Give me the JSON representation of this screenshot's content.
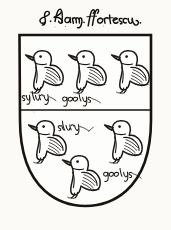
{
  "image": {
    "kind": "heraldic-shield-illustration",
    "medium": "pen-and-ink line drawing",
    "width": 171,
    "height": 230,
    "paper_color": "#fbfaf7",
    "ink_color": "#1a1713"
  },
  "caption": {
    "name": "caption-inscription",
    "transcription": "S. Hugh ffortescu",
    "reading_note": "cursive secretary-hand inscription above the shield",
    "position": "above-shield"
  },
  "shield": {
    "name": "coat-of-arms-shield",
    "outline_color": "#17130f",
    "field_color": "#fdfdfb",
    "shape": "flat-top-heater",
    "bounds": {
      "left": 18,
      "top": 34,
      "right": 152,
      "bottom": 206
    },
    "division": {
      "name": "fess-division-line",
      "type": "per fess",
      "y": 110
    },
    "blazon": "Six birds, three in chief and three in base, divided per fess"
  },
  "charges": [
    {
      "name": "bird-chief-dexter",
      "type": "chough",
      "row": "chief",
      "position": 1,
      "facing": "sinister"
    },
    {
      "name": "bird-chief-middle",
      "type": "chough",
      "row": "chief",
      "position": 2,
      "facing": "sinister"
    },
    {
      "name": "bird-chief-sinister",
      "type": "chough",
      "row": "chief",
      "position": 3,
      "facing": "sinister"
    },
    {
      "name": "bird-base-dexter",
      "type": "chough",
      "row": "base",
      "position": 4,
      "facing": "sinister"
    },
    {
      "name": "bird-base-sinister",
      "type": "chough",
      "row": "base",
      "position": 5,
      "facing": "sinister"
    },
    {
      "name": "bird-base-middle",
      "type": "chough",
      "row": "base",
      "position": 6,
      "facing": "sinister"
    }
  ],
  "tincture_notes": [
    {
      "name": "tincture-note-sylver-chief",
      "text": "sylvyr",
      "meaning": "argent / silver",
      "x": 24,
      "y": 96
    },
    {
      "name": "tincture-note-goolys-chief",
      "text": "goolys",
      "meaning": "gules / red",
      "x": 62,
      "y": 99
    },
    {
      "name": "tincture-note-sylver-base",
      "text": "sylvyr",
      "meaning": "argent / silver",
      "x": 58,
      "y": 126
    },
    {
      "name": "tincture-note-goolys-base",
      "text": "goolys",
      "meaning": "gules / red",
      "x": 103,
      "y": 174
    }
  ]
}
